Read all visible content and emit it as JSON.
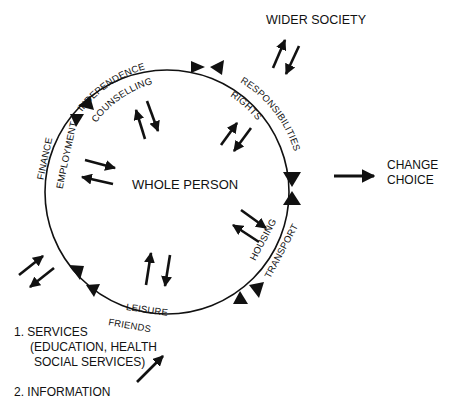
{
  "center": {
    "label": "WHOLE PERSON"
  },
  "external": {
    "wider_society": "WIDER SOCIETY",
    "change": "CHANGE",
    "choice": "CHOICE"
  },
  "inputs": {
    "services_line1": "1.  SERVICES",
    "services_line2": "(EDUCATION, HEALTH",
    "services_line3": "SOCIAL SERVICES)",
    "information": "2.  INFORMATION"
  },
  "arcs": [
    {
      "outer": "INDEPENDENCE",
      "inner": "COUNSELLING"
    },
    {
      "outer": "RESPONSIBILITIES",
      "inner": "RIGHTS"
    },
    {
      "outer": "TRANSPORT",
      "inner": "HOUSING"
    },
    {
      "outer": "FRIENDS",
      "inner": "LEISURE"
    },
    {
      "outer": "FINANCE",
      "inner": "EMPLOYMENT"
    }
  ],
  "colors": {
    "ink": "#111111",
    "background": "#ffffff"
  }
}
